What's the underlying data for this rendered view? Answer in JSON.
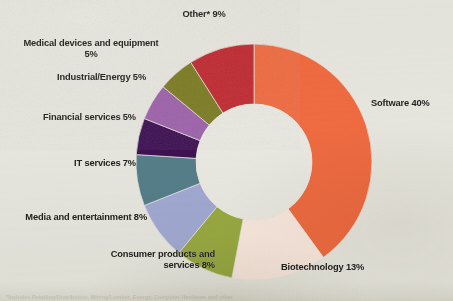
{
  "chart_data": {
    "type": "pie",
    "variant": "donut",
    "title": "",
    "subtitle": "",
    "xlabel": "",
    "ylabel": "",
    "legend_position": "none",
    "labels_position": "outside-radial",
    "grid": false,
    "units": "percent",
    "total": 100,
    "start_angle_deg": 0,
    "direction": "clockwise",
    "categories": [
      "Software",
      "Biotechnology",
      "Consumer products and services",
      "Media and entertainment",
      "IT services",
      "Financial services",
      "Industrial/Energy",
      "Medical devices and equipment",
      "Other*"
    ],
    "values": [
      40,
      13,
      8,
      8,
      7,
      5,
      5,
      5,
      9
    ],
    "colors": [
      "#f26c42",
      "#fbeae2",
      "#9aab42",
      "#a3abd6",
      "#56808c",
      "#3f1154",
      "#9f63ad",
      "#7d7d24",
      "#c22b32"
    ],
    "slices": [
      {
        "label": "Software",
        "value": 40,
        "display": "Software 40%",
        "color": "#f26c42"
      },
      {
        "label": "Biotechnology",
        "value": 13,
        "display": "Biotechnology 13%",
        "color": "#fbeae2"
      },
      {
        "label": "Consumer products and services",
        "value": 8,
        "display": "Consumer products and\nservices 8%",
        "color": "#9aab42"
      },
      {
        "label": "Media and entertainment",
        "value": 8,
        "display": "Media and entertainment 8%",
        "color": "#a3abd6"
      },
      {
        "label": "IT services",
        "value": 7,
        "display": "IT services 7%",
        "color": "#56808c"
      },
      {
        "label": "Financial services",
        "value": 5,
        "display": "Financial services 5%",
        "color": "#3f1154"
      },
      {
        "label": "Industrial/Energy",
        "value": 5,
        "display": "Industrial/Energy 5%",
        "color": "#9f63ad"
      },
      {
        "label": "Medical devices and equipment",
        "value": 5,
        "display": "Medical devices and equipment\n5%",
        "color": "#7d7d24"
      },
      {
        "label": "Other*",
        "value": 9,
        "display": "Other* 9%",
        "color": "#c22b32"
      }
    ]
  },
  "labels": {
    "software": "Software 40%",
    "biotechnology": "Biotechnology 13%",
    "consumer": "Consumer products and\nservices 8%",
    "media": "Media and entertainment 8%",
    "itservices": "IT services 7%",
    "financial": "Financial services 5%",
    "industrial": "Industrial/Energy 5%",
    "medical": "Medical devices and equipment\n5%",
    "other": "Other* 9%"
  },
  "footnote": {
    "text": "*Includes Retailing/Distribution, Mining/Lumber, Energy, Computer Hardware and other"
  },
  "style": {
    "background_color": "#e9e8e2",
    "label_color": "#232320",
    "hole_color": "#ecebe5"
  }
}
